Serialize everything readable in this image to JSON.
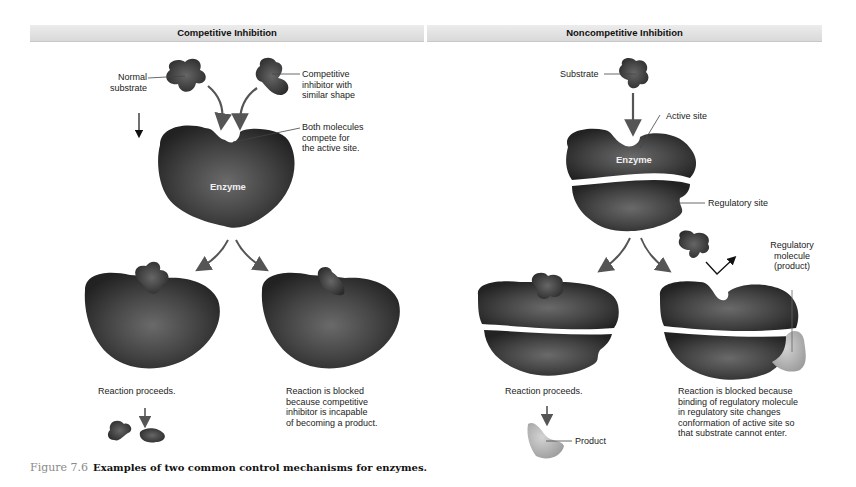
{
  "panels": {
    "left": {
      "title": "Competitive Inhibition",
      "labels": {
        "normal_substrate": "Normal\nsubstrate",
        "competitive_inhibitor": "Competitive\ninhibitor with\nsimilar shape",
        "both_compete": "Both molecules\ncompete for\nthe active site.",
        "enzyme": "Enzyme",
        "reaction_proceeds": "Reaction proceeds.",
        "reaction_blocked": "Reaction is blocked\nbecause competitive\ninhibitor is incapable\nof becoming a product."
      }
    },
    "right": {
      "title": "Noncompetitive Inhibition",
      "labels": {
        "substrate": "Substrate",
        "active_site": "Active site",
        "enzyme": "Enzyme",
        "regulatory_site": "Regulatory site",
        "regulatory_molecule": "Regulatory\nmolecule\n(product)",
        "reaction_proceeds": "Reaction proceeds.",
        "product": "Product",
        "reaction_blocked": "Reaction is blocked because\nbinding of regulatory molecule\nin regulatory site changes\nconformation of active site so\nthat substrate cannot enter."
      }
    }
  },
  "caption": {
    "figure_number": "Figure 7.6",
    "text": "Examples of two common control mechanisms for enzymes."
  },
  "colors": {
    "enzyme": "#3a3a3a",
    "substrate": "#444444",
    "product": "#b5b5b5",
    "header_bg": "#e0e0e0",
    "arrow": "#555555"
  }
}
